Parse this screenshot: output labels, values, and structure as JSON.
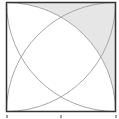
{
  "diagram": {
    "type": "square-with-quarter-circle-arcs",
    "square": {
      "x": 6.5,
      "y": 2.5,
      "size": 109
    },
    "colors": {
      "background": "#ffffff",
      "square_stroke": "#333333",
      "arc_stroke": "#a8a8a8",
      "shaded_fill": "#e6e6e6",
      "tick": "#444444"
    },
    "arcs": [
      {
        "center": "bottom-left",
        "label": ""
      },
      {
        "center": "bottom-right",
        "label": ""
      },
      {
        "center": "top-left",
        "label": ""
      },
      {
        "center": "top-right",
        "label": ""
      }
    ],
    "shaded_region": "top-right region between arcs and square edges",
    "ticks": [
      {
        "position": "left"
      },
      {
        "position": "middle"
      },
      {
        "position": "right"
      }
    ]
  }
}
